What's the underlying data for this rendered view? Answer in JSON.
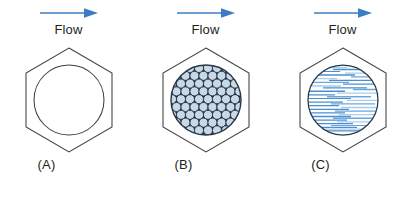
{
  "figure": {
    "background_color": "#ffffff",
    "width": 411,
    "height": 197,
    "arrow_color": "#3b7cc4",
    "outline_color": "#3f3f44",
    "sphere_fill": "#c8d8e6",
    "sphere_stroke": "#1c2b3a",
    "striation_color": "#4a8fd0",
    "striation_light": "#a9cdea",
    "text_color": "#231f20"
  },
  "panels": [
    {
      "id": "panel-a",
      "label": "(A)",
      "flow_label": "Flow",
      "arrow_icon": "right-arrow-icon",
      "fill_type": "empty",
      "description": "Hexagonal channel with empty open circular cross-section"
    },
    {
      "id": "panel-b",
      "label": "(B)",
      "flow_label": "Flow",
      "arrow_icon": "right-arrow-icon",
      "fill_type": "packed-spheres",
      "description": "Hexagonal channel with circular cross-section packed with spherical particles"
    },
    {
      "id": "panel-c",
      "label": "(C)",
      "flow_label": "Flow",
      "arrow_icon": "right-arrow-icon",
      "fill_type": "horizontal-striations",
      "description": "Hexagonal channel with circular cross-section containing horizontal fibrous striations"
    }
  ]
}
